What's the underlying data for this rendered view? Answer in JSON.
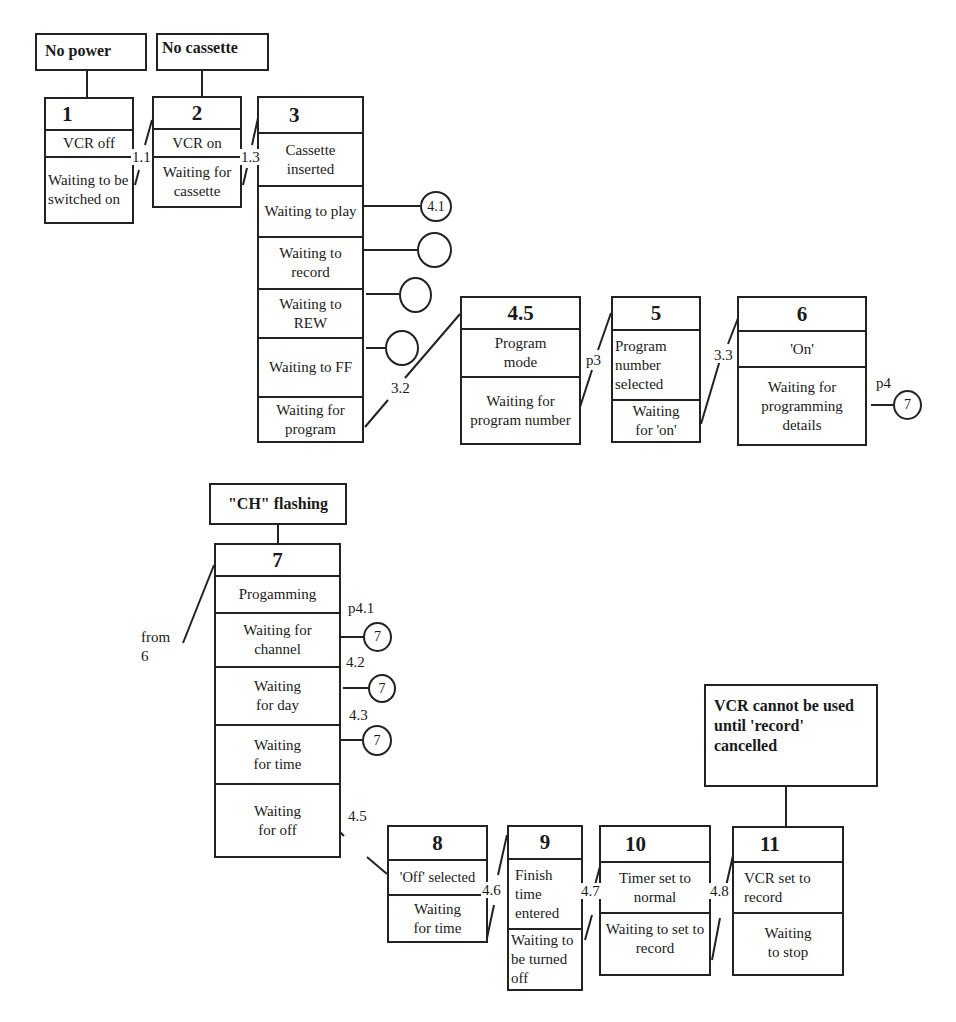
{
  "notes": {
    "no_power": "No power",
    "no_cassette": "No cassette",
    "ch_flashing": "\"CH\" flashing",
    "vcr_cannot": "VCR cannot be used until 'record' cancelled"
  },
  "states": {
    "s1": {
      "id": "1",
      "sections": [
        "VCR off",
        "Waiting to be switched on"
      ]
    },
    "s2": {
      "id": "2",
      "sections": [
        "VCR on",
        "Waiting for cassette"
      ]
    },
    "s3": {
      "id": "3",
      "sections": [
        "Cassette inserted",
        "Waiting to play",
        "Waiting to record",
        "Waiting to REW",
        "Waiting to FF",
        "Waiting for program"
      ]
    },
    "s45": {
      "id": "4.5",
      "sections": [
        "Program mode",
        "Waiting for program number"
      ]
    },
    "s5": {
      "id": "5",
      "sections": [
        "Program number selected",
        "Waiting for 'on'"
      ]
    },
    "s6": {
      "id": "6",
      "sections": [
        "'On'",
        "Waiting for programming details"
      ]
    },
    "s7": {
      "id": "7",
      "sections": [
        "Progamming",
        "Waiting for channel",
        "Waiting for day",
        "Waiting for time",
        "Waiting for off"
      ]
    },
    "s8": {
      "id": "8",
      "sections": [
        "'Off' selected",
        "Waiting for time"
      ]
    },
    "s9": {
      "id": "9",
      "sections": [
        "Finish time entered",
        "Waiting to be turned off"
      ]
    },
    "s10": {
      "id": "10",
      "sections": [
        "Timer set to normal",
        "Waiting to set to record"
      ]
    },
    "s11": {
      "id": "11",
      "sections": [
        "VCR set to record",
        "Waiting to stop"
      ]
    }
  },
  "transitions": {
    "t11": "1.1",
    "t13": "1.3",
    "t32": "3.2",
    "tp3": "p3",
    "t33": "3.3",
    "tp4": "p4",
    "tp41": "p4.1",
    "t42": "4.2",
    "t43": "4.3",
    "t45": "4.5",
    "t46": "4.6",
    "t47": "4.7",
    "t48": "4.8",
    "from6": "from 6"
  },
  "circles": {
    "play": "4.1",
    "record": "",
    "rew": "",
    "ff": "",
    "details": "7",
    "channel": "7",
    "day": "7",
    "time": "7"
  }
}
